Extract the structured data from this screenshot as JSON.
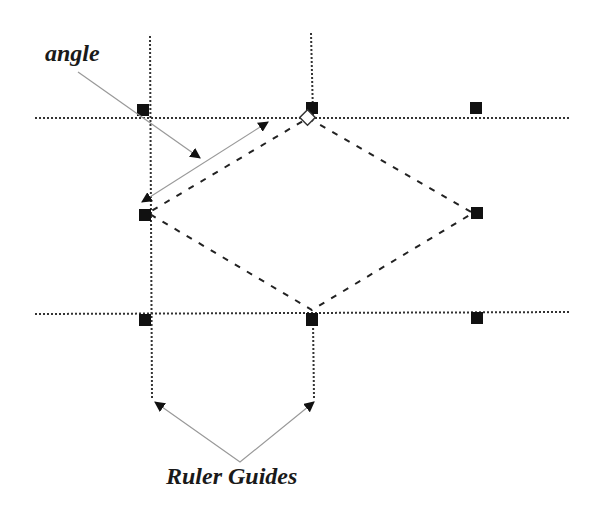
{
  "labels": {
    "angle": "angle",
    "ruler_guides": "Ruler Guides"
  },
  "colors": {
    "guide": "#333333",
    "handle": "#111111",
    "callout": "#999999",
    "text": "#1a1a1a"
  },
  "guides": {
    "horizontal_y": [
      118,
      314
    ],
    "vertical_x": [
      150,
      312
    ]
  },
  "shape": {
    "type": "diamond",
    "points": [
      [
        308,
        118
      ],
      [
        473,
        213
      ],
      [
        312,
        310
      ],
      [
        148,
        213
      ]
    ]
  },
  "handles": [
    {
      "x": 143,
      "y": 110
    },
    {
      "x": 312,
      "y": 108
    },
    {
      "x": 476,
      "y": 108
    },
    {
      "x": 145,
      "y": 215
    },
    {
      "x": 477,
      "y": 213
    },
    {
      "x": 145,
      "y": 320
    },
    {
      "x": 312,
      "y": 320
    },
    {
      "x": 477,
      "y": 318
    }
  ]
}
